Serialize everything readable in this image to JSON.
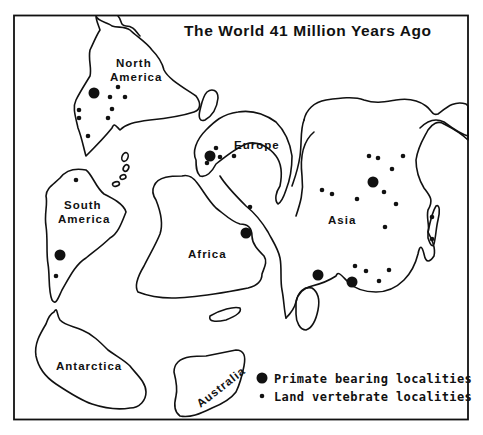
{
  "title": "The World 41 Million Years Ago",
  "continents": [
    {
      "name": "North America",
      "label_lines": [
        "North",
        "America"
      ]
    },
    {
      "name": "South America",
      "label_lines": [
        "South",
        "America"
      ]
    },
    {
      "name": "Europe",
      "label_lines": [
        "Europe"
      ]
    },
    {
      "name": "Africa",
      "label_lines": [
        "Africa"
      ]
    },
    {
      "name": "Asia",
      "label_lines": [
        "Asia"
      ]
    },
    {
      "name": "Antarctica",
      "label_lines": [
        "Antarctica"
      ]
    },
    {
      "name": "Australia",
      "label_lines": [
        "Australia"
      ]
    }
  ],
  "legend": {
    "items": [
      {
        "symbol": "large-dot",
        "label": "Primate bearing localities"
      },
      {
        "symbol": "small-dot",
        "label": "Land vertebrate localities"
      }
    ]
  },
  "localities": {
    "primate": [
      [
        94,
        93
      ],
      [
        210,
        156
      ],
      [
        60,
        255
      ],
      [
        246,
        233
      ],
      [
        373,
        182
      ],
      [
        318,
        275
      ],
      [
        352,
        282
      ]
    ],
    "land_vertebrate": [
      [
        118,
        87
      ],
      [
        110,
        97
      ],
      [
        125,
        97
      ],
      [
        112,
        109
      ],
      [
        108,
        118
      ],
      [
        79,
        110
      ],
      [
        79,
        118
      ],
      [
        88,
        136
      ],
      [
        76,
        180
      ],
      [
        56,
        276
      ],
      [
        216,
        148
      ],
      [
        220,
        157
      ],
      [
        207,
        163
      ],
      [
        234,
        156
      ],
      [
        250,
        207
      ],
      [
        369,
        156
      ],
      [
        378,
        158
      ],
      [
        403,
        156
      ],
      [
        392,
        169
      ],
      [
        384,
        192
      ],
      [
        396,
        204
      ],
      [
        322,
        190
      ],
      [
        332,
        194
      ],
      [
        357,
        199
      ],
      [
        385,
        227
      ],
      [
        432,
        217
      ],
      [
        432,
        239
      ],
      [
        355,
        266
      ],
      [
        366,
        271
      ],
      [
        389,
        270
      ],
      [
        379,
        281
      ]
    ]
  },
  "colors": {
    "ink": "#111111",
    "paper": "#ffffff"
  }
}
